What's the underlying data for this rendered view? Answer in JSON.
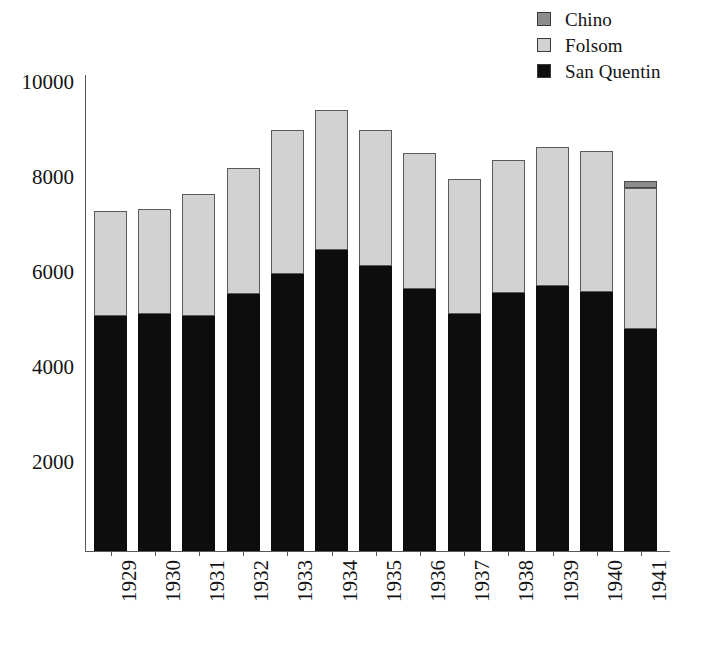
{
  "chart_data": {
    "type": "bar",
    "subtype": "stacked-bar",
    "title": "",
    "subtitle": "",
    "xlabel": "",
    "ylabel": "",
    "categories": [
      "1929",
      "1930",
      "1931",
      "1932",
      "1933",
      "1934",
      "1935",
      "1936",
      "1937",
      "1938",
      "1939",
      "1940",
      "1941"
    ],
    "series": [
      {
        "name": "San Quentin",
        "color": "#0d0d0d",
        "values": [
          4940,
          4980,
          4940,
          5420,
          5840,
          6330,
          6010,
          5510,
          4980,
          5440,
          5570,
          5460,
          4680
        ]
      },
      {
        "name": "Folsom",
        "color": "#d2d2d2",
        "values": [
          2210,
          2210,
          2570,
          2640,
          3020,
          2950,
          2850,
          2870,
          2850,
          2790,
          2930,
          2960,
          2960
        ]
      },
      {
        "name": "Chino",
        "color": "#8c8c8c",
        "values": [
          0,
          0,
          0,
          0,
          0,
          0,
          0,
          0,
          0,
          0,
          0,
          0,
          150
        ]
      }
    ],
    "totals": [
      7150,
      7190,
      7510,
      8060,
      8860,
      9280,
      8860,
      8380,
      7830,
      8230,
      8500,
      8420,
      7790
    ],
    "ylim": [
      0,
      10400
    ],
    "yticks": [
      2000,
      4000,
      6000,
      8000,
      10000
    ],
    "ytick_labels": [
      "2000",
      "4000",
      "6000",
      "8000",
      "10000"
    ],
    "grid": false,
    "legend_position": "top-right",
    "stack_order_bottom_to_top": [
      "San Quentin",
      "Folsom",
      "Chino"
    ]
  },
  "legend": {
    "items": [
      {
        "label": "Chino",
        "color": "#8c8c8c"
      },
      {
        "label": "Folsom",
        "color": "#d2d2d2"
      },
      {
        "label": "San Quentin",
        "color": "#0d0d0d"
      }
    ]
  },
  "axes": {
    "y_tick_labels": [
      "10000",
      "8000",
      "6000",
      "4000",
      "2000"
    ],
    "x_tick_labels": [
      "1929",
      "1930",
      "1931",
      "1932",
      "1933",
      "1934",
      "1935",
      "1936",
      "1937",
      "1938",
      "1939",
      "1940",
      "1941"
    ]
  }
}
